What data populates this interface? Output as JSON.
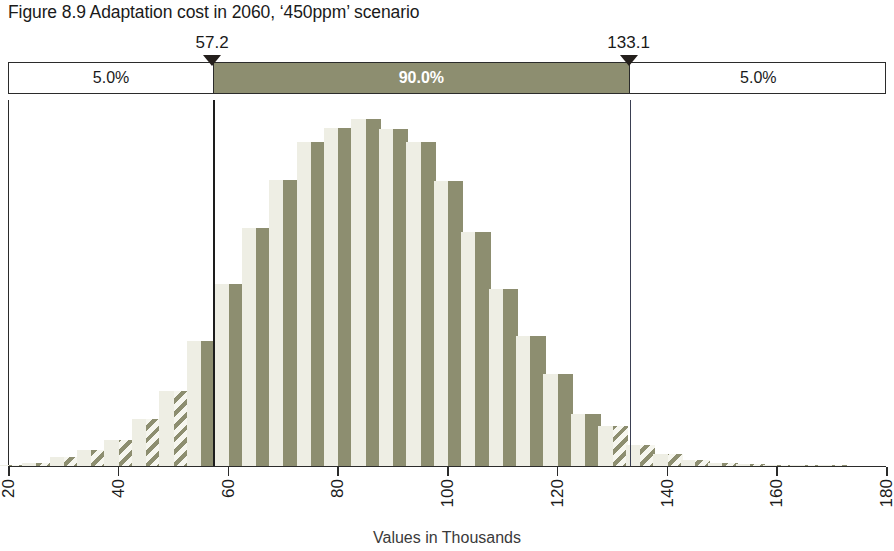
{
  "title": "Figure 8.9 Adaptation cost in 2060, ‘450ppm’ scenario",
  "band": {
    "left_pct": "5.0%",
    "mid_pct": "90.0%",
    "right_pct": "5.0%"
  },
  "markers": [
    {
      "name": "lower-bound",
      "label": "57.2",
      "value": 57.2
    },
    {
      "name": "upper-bound",
      "label": "133.1",
      "value": 133.1
    }
  ],
  "colors": {
    "olive": "#8d8e70",
    "pale": "#eeeee4",
    "line": "#2b2b2b",
    "vline": "#3a3f52"
  },
  "chart_data": {
    "type": "bar",
    "title": "Figure 8.9 Adaptation cost in 2060, ‘450ppm’ scenario",
    "xlabel": "Values in Thousands",
    "ylabel": "",
    "xlim": [
      20,
      180
    ],
    "xticks": [
      20,
      40,
      60,
      80,
      100,
      120,
      140,
      160,
      180
    ],
    "xtick_labels": [
      "20",
      "40",
      "60",
      "80",
      "100",
      "120",
      "140",
      "160",
      "180"
    ],
    "grid": false,
    "legend": false,
    "bin_width": 5,
    "annotations": [
      {
        "text": "5.0%",
        "region": "left-tail"
      },
      {
        "text": "90.0%",
        "region": "central-interval"
      },
      {
        "text": "5.0%",
        "region": "right-tail"
      },
      {
        "text": "57.2",
        "region": "p5-marker"
      },
      {
        "text": "133.1",
        "region": "p95-marker"
      }
    ],
    "percentiles": {
      "p5": 57.2,
      "p95": 133.1,
      "interval_pct": 90.0
    },
    "bins": [
      {
        "x": 22.5,
        "value": 0.3,
        "inside": false
      },
      {
        "x": 27.5,
        "value": 0.9,
        "inside": false
      },
      {
        "x": 32.5,
        "value": 2.5,
        "inside": false
      },
      {
        "x": 37.5,
        "value": 4.5,
        "inside": false
      },
      {
        "x": 42.5,
        "value": 7.5,
        "inside": false
      },
      {
        "x": 47.5,
        "value": 13.5,
        "inside": false
      },
      {
        "x": 52.5,
        "value": 21.5,
        "inside": false
      },
      {
        "x": 57.5,
        "value": 36.0,
        "inside": true
      },
      {
        "x": 62.5,
        "value": 52.5,
        "inside": true
      },
      {
        "x": 67.5,
        "value": 68.5,
        "inside": true
      },
      {
        "x": 72.5,
        "value": 82.5,
        "inside": true
      },
      {
        "x": 77.5,
        "value": 93.5,
        "inside": true
      },
      {
        "x": 82.5,
        "value": 97.5,
        "inside": true
      },
      {
        "x": 87.5,
        "value": 100.0,
        "inside": true
      },
      {
        "x": 92.5,
        "value": 97.0,
        "inside": true
      },
      {
        "x": 97.5,
        "value": 93.5,
        "inside": true
      },
      {
        "x": 102.5,
        "value": 82.0,
        "inside": true
      },
      {
        "x": 107.5,
        "value": 67.5,
        "inside": true
      },
      {
        "x": 112.5,
        "value": 51.0,
        "inside": true
      },
      {
        "x": 117.5,
        "value": 37.5,
        "inside": true
      },
      {
        "x": 122.5,
        "value": 26.5,
        "inside": true
      },
      {
        "x": 127.5,
        "value": 15.0,
        "inside": true
      },
      {
        "x": 132.5,
        "value": 11.5,
        "inside": false
      },
      {
        "x": 137.5,
        "value": 6.0,
        "inside": false
      },
      {
        "x": 142.5,
        "value": 3.5,
        "inside": false
      },
      {
        "x": 147.5,
        "value": 1.8,
        "inside": false
      },
      {
        "x": 152.5,
        "value": 0.9,
        "inside": false
      },
      {
        "x": 157.5,
        "value": 0.5,
        "inside": false
      },
      {
        "x": 162.5,
        "value": 0.3,
        "inside": false
      },
      {
        "x": 167.5,
        "value": 0.2,
        "inside": false
      },
      {
        "x": 172.5,
        "value": 0.2,
        "inside": false
      }
    ]
  }
}
